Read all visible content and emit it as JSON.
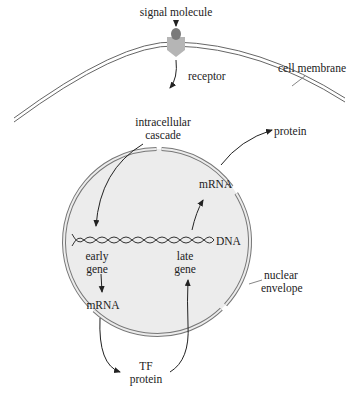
{
  "diagram": {
    "type": "signal-transduction",
    "colors": {
      "background": "#ffffff",
      "nucleus_fill": "#ececec",
      "membrane_stroke": "#666666",
      "receptor_fill": "#b5b5b5",
      "signal_molecule_fill": "#7a7a7a",
      "text": "#222222",
      "arrow": "#222222"
    },
    "labels": {
      "signal_molecule": "signal molecule",
      "receptor": "receptor",
      "cell_membrane": "cell membrane",
      "intracellular_1": "intracellular",
      "intracellular_2": "cascade",
      "protein_top": "protein",
      "mrna_top": "mRNA",
      "dna": "DNA",
      "early_1": "early",
      "early_2": "gene",
      "late_1": "late",
      "late_2": "gene",
      "nuclear_1": "nuclear",
      "nuclear_2": "envelope",
      "mrna_bottom": "mRNA",
      "tf_1": "TF",
      "tf_2": "protein"
    }
  }
}
